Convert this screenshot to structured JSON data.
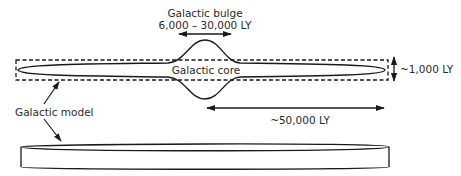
{
  "labels": {
    "bulge_title": "Galactic bulge",
    "bulge_size": "6,000 – 30,000 LY",
    "core": "Galactic core",
    "thickness": "~1,000 LY",
    "radius": "~50,000 LY",
    "model": "Galactic model"
  },
  "colors": {
    "stroke": "#1a1a1a",
    "text": "#2a2a2a",
    "background": "#ffffff"
  }
}
